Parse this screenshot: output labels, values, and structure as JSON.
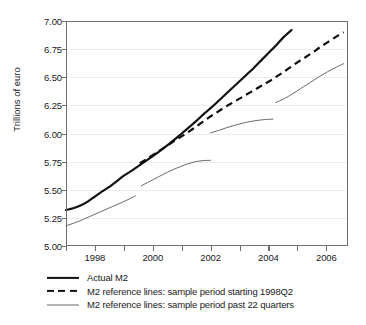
{
  "chart_data": {
    "type": "line",
    "title": "",
    "xlabel": "",
    "ylabel": "Trillions of euro",
    "xlim": [
      1997.0,
      2006.75
    ],
    "ylim": [
      5.0,
      7.0
    ],
    "grid": true,
    "legend_position": "below",
    "yticks": [
      5.0,
      5.25,
      5.5,
      5.75,
      6.0,
      6.25,
      6.5,
      6.75,
      7.0
    ],
    "ytick_labels": [
      "5.00",
      "5.25",
      "5.50",
      "5.75",
      "6.00",
      "6.25",
      "6.50",
      "6.75",
      "7.00"
    ],
    "xticks_major": [
      1998,
      2000,
      2002,
      2004,
      2006
    ],
    "xtick_labels": [
      "1998",
      "2000",
      "2002",
      "2004",
      "2006"
    ],
    "xticks_minor": [
      1997,
      1999,
      2001,
      2003,
      2005
    ],
    "series": [
      {
        "name": "Actual M2",
        "style": "solid",
        "width": "thick",
        "color": "#111111",
        "points": [
          [
            1997.0,
            5.32
          ],
          [
            1997.25,
            5.335
          ],
          [
            1997.5,
            5.36
          ],
          [
            1997.75,
            5.395
          ],
          [
            1998.0,
            5.44
          ],
          [
            1998.25,
            5.485
          ],
          [
            1998.5,
            5.525
          ],
          [
            1998.75,
            5.575
          ],
          [
            1999.0,
            5.625
          ],
          [
            1999.25,
            5.665
          ],
          [
            1999.5,
            5.71
          ],
          [
            1999.75,
            5.755
          ],
          [
            2000.0,
            5.8
          ],
          [
            2000.25,
            5.845
          ],
          [
            2000.5,
            5.895
          ],
          [
            2000.75,
            5.945
          ],
          [
            2001.0,
            6.0
          ],
          [
            2001.25,
            6.055
          ],
          [
            2001.5,
            6.11
          ],
          [
            2001.75,
            6.17
          ],
          [
            2002.0,
            6.225
          ],
          [
            2002.25,
            6.285
          ],
          [
            2002.5,
            6.345
          ],
          [
            2002.75,
            6.405
          ],
          [
            2003.0,
            6.465
          ],
          [
            2003.25,
            6.525
          ],
          [
            2003.5,
            6.585
          ],
          [
            2003.75,
            6.65
          ],
          [
            2004.0,
            6.715
          ],
          [
            2004.25,
            6.78
          ],
          [
            2004.5,
            6.85
          ],
          [
            2004.8,
            6.92
          ]
        ]
      },
      {
        "name": "M2 reference lines: sample period starting 1998Q2",
        "style": "dashed",
        "width": "thick",
        "color": "#111111",
        "points": [
          [
            1999.55,
            5.735
          ],
          [
            1999.8,
            5.775
          ],
          [
            2000.1,
            5.825
          ],
          [
            2000.4,
            5.875
          ],
          [
            2000.7,
            5.925
          ],
          [
            2001.0,
            5.975
          ],
          [
            2001.3,
            6.025
          ],
          [
            2001.6,
            6.08
          ],
          [
            2001.9,
            6.135
          ],
          [
            2002.2,
            6.185
          ],
          [
            2002.5,
            6.235
          ],
          [
            2002.8,
            6.28
          ],
          [
            2003.1,
            6.325
          ],
          [
            2003.4,
            6.37
          ],
          [
            2003.7,
            6.415
          ],
          [
            2004.0,
            6.46
          ],
          [
            2004.3,
            6.51
          ],
          [
            2004.6,
            6.56
          ],
          [
            2004.9,
            6.615
          ],
          [
            2005.2,
            6.665
          ],
          [
            2005.5,
            6.715
          ],
          [
            2005.8,
            6.77
          ],
          [
            2006.1,
            6.82
          ],
          [
            2006.4,
            6.87
          ],
          [
            2006.6,
            6.9
          ]
        ]
      },
      {
        "name": "M2 reference lines: sample period past 22 quarters",
        "style": "solid",
        "width": "thin",
        "color": "#6a6a6a",
        "segments": [
          {
            "label": "segment-1",
            "points": [
              [
                1997.0,
                5.18
              ],
              [
                1997.4,
                5.215
              ],
              [
                1997.8,
                5.26
              ],
              [
                1998.2,
                5.305
              ],
              [
                1998.6,
                5.35
              ],
              [
                1999.0,
                5.395
              ],
              [
                1999.4,
                5.445
              ]
            ]
          },
          {
            "label": "segment-2",
            "points": [
              [
                1999.6,
                5.535
              ],
              [
                1999.9,
                5.575
              ],
              [
                2000.2,
                5.615
              ],
              [
                2000.5,
                5.655
              ],
              [
                2000.8,
                5.69
              ],
              [
                2001.1,
                5.72
              ],
              [
                2001.4,
                5.745
              ],
              [
                2001.7,
                5.758
              ],
              [
                2002.0,
                5.762
              ]
            ]
          },
          {
            "label": "segment-3",
            "points": [
              [
                2002.0,
                6.005
              ],
              [
                2002.3,
                6.03
              ],
              [
                2002.6,
                6.055
              ],
              [
                2002.9,
                6.078
              ],
              [
                2003.2,
                6.098
              ],
              [
                2003.5,
                6.112
              ],
              [
                2003.8,
                6.122
              ],
              [
                2004.15,
                6.128
              ]
            ]
          },
          {
            "label": "segment-4",
            "points": [
              [
                2004.25,
                6.275
              ],
              [
                2004.55,
                6.31
              ],
              [
                2004.85,
                6.355
              ],
              [
                2005.15,
                6.405
              ],
              [
                2005.45,
                6.455
              ],
              [
                2005.75,
                6.505
              ],
              [
                2006.05,
                6.55
              ],
              [
                2006.35,
                6.59
              ],
              [
                2006.6,
                6.62
              ]
            ]
          }
        ]
      }
    ]
  },
  "axes": {
    "ylabel": "Trillions of euro",
    "ytick_labels": [
      "7.00",
      "6.75",
      "6.50",
      "6.25",
      "6.00",
      "5.75",
      "5.50",
      "5.25",
      "5.00"
    ],
    "xtick_labels": [
      "1998",
      "2000",
      "2002",
      "2004",
      "2006"
    ]
  },
  "legend": {
    "items": [
      {
        "label": "Actual M2",
        "swatch": "solid-thick-line-icon"
      },
      {
        "label": "M2 reference lines: sample period starting 1998Q2",
        "swatch": "dashed-line-icon"
      },
      {
        "label": "M2 reference lines: sample period past 22 quarters",
        "swatch": "solid-thin-line-icon"
      }
    ]
  }
}
